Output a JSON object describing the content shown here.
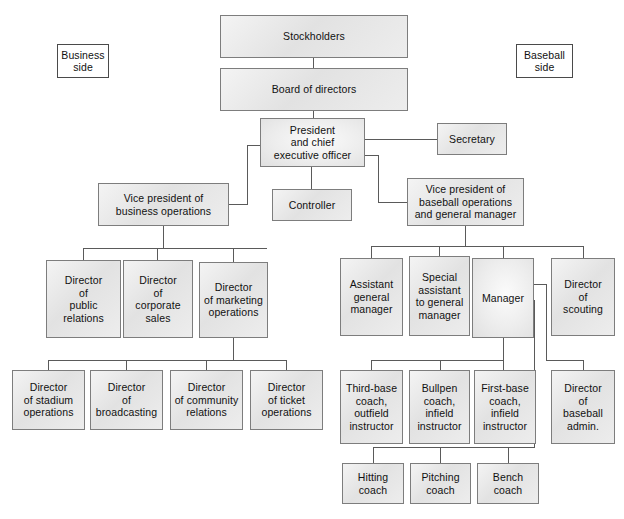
{
  "diagram": {
    "type": "org-chart",
    "colors": {
      "box_fill": "#ededed",
      "box_border": "#7d7d7d",
      "side_box_fill": "#ffffff",
      "side_box_border": "#4a4a4a",
      "line": "#5a5a5a",
      "text": "#111111",
      "background": "#ffffff"
    }
  },
  "side_labels": {
    "business": "Business\nside",
    "baseball": "Baseball\nside"
  },
  "nodes": {
    "stockholders": "Stockholders",
    "board_of_directors": "Board of directors",
    "president": "President\nand chief\nexecutive officer",
    "secretary": "Secretary",
    "controller": "Controller",
    "vp_business": "Vice president of\nbusiness operations",
    "vp_baseball": "Vice president of\nbaseball operations\nand general manager",
    "dir_public_relations": "Director\nof\npublic\nrelations",
    "dir_corporate_sales": "Director\nof\ncorporate\nsales",
    "dir_marketing_operations": "Director\nof marketing\noperations",
    "dir_stadium_operations": "Director\nof stadium\noperations",
    "dir_broadcasting": "Director\nof\nbroadcasting",
    "dir_community_relations": "Director\nof community\nrelations",
    "dir_ticket_operations": "Director\nof ticket\noperations",
    "assistant_gm": "Assistant\ngeneral\nmanager",
    "special_assistant": "Special\nassistant\nto general\nmanager",
    "manager": "Manager",
    "dir_scouting": "Director\nof\nscouting",
    "third_base_coach": "Third-base\ncoach,\noutfield\ninstructor",
    "bullpen_coach": "Bullpen\ncoach,\ninfield\ninstructor",
    "first_base_coach": "First-base\ncoach,\ninfield\ninstructor",
    "dir_baseball_admin": "Director\nof\nbaseball\nadmin.",
    "hitting_coach": "Hitting\ncoach",
    "pitching_coach": "Pitching\ncoach",
    "bench_coach": "Bench\ncoach"
  }
}
